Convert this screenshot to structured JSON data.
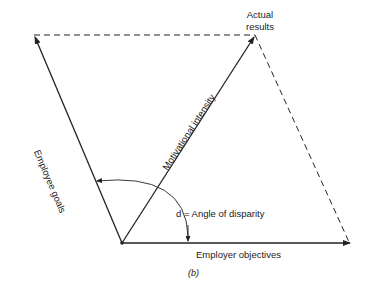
{
  "diagram": {
    "type": "vector-parallelogram",
    "labels": {
      "actual_results_line1": "Actual",
      "actual_results_line2": "results",
      "employee_goals": "Employee goals",
      "motivational_intensity": "Motivational intensity",
      "angle": "d = Angle of disparity",
      "employer_objectives": "Employer objectives",
      "caption": "(b)"
    },
    "colors": {
      "line": "#222222",
      "background": "#ffffff"
    }
  }
}
